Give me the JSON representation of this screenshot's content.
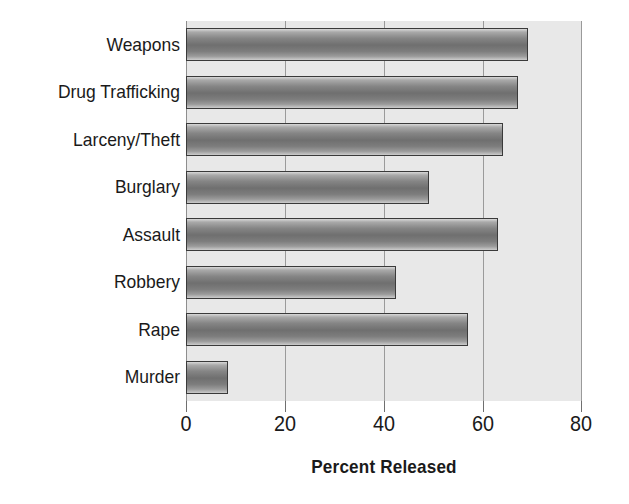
{
  "chart_data": {
    "type": "bar",
    "orientation": "horizontal",
    "title": "",
    "xlabel": "Percent Released",
    "ylabel": "",
    "categories": [
      "Murder",
      "Rape",
      "Robbery",
      "Assault",
      "Burglary",
      "Larceny/Theft",
      "Drug Trafficking",
      "Weapons"
    ],
    "values": [
      8.5,
      57,
      42.5,
      63,
      49,
      64,
      67,
      69
    ],
    "xlim": [
      0,
      80
    ],
    "xticks": [
      0,
      20,
      40,
      60,
      80
    ],
    "xtick_labels": [
      "0",
      "20",
      "40",
      "60",
      "80"
    ],
    "grid": "vertical",
    "legend": "none",
    "display_order_top_to_bottom": [
      "Weapons",
      "Drug Trafficking",
      "Larceny/Theft",
      "Burglary",
      "Assault",
      "Robbery",
      "Rape",
      "Murder"
    ],
    "colors": {
      "plot_background": "#e8e8e8",
      "bar_fill_dark": "#6f6f6f",
      "bar_fill_light": "#d8d8d8",
      "bar_border": "#3a3a3a",
      "gridline": "#9a9a9a",
      "text": "#1a1a1a",
      "page_background": "#ffffff"
    }
  },
  "axis": {
    "title": "Percent Released"
  },
  "ticks": [
    {
      "label": "0",
      "value": 0
    },
    {
      "label": "20",
      "value": 20
    },
    {
      "label": "40",
      "value": 40
    },
    {
      "label": "60",
      "value": 60
    },
    {
      "label": "80",
      "value": 80
    }
  ],
  "bars": [
    {
      "label": "Weapons",
      "value": 69
    },
    {
      "label": "Drug Trafficking",
      "value": 67
    },
    {
      "label": "Larceny/Theft",
      "value": 64
    },
    {
      "label": "Burglary",
      "value": 49
    },
    {
      "label": "Assault",
      "value": 63
    },
    {
      "label": "Robbery",
      "value": 42.5
    },
    {
      "label": "Rape",
      "value": 57
    },
    {
      "label": "Murder",
      "value": 8.5
    }
  ]
}
